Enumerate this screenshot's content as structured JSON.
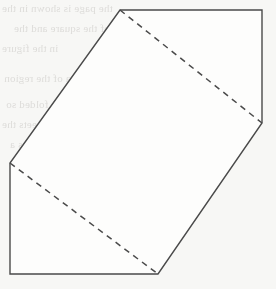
{
  "page": {
    "width": 276,
    "height": 289,
    "background_color": "#f7f7f5"
  },
  "figure": {
    "name": "folded-square-over-rectangle",
    "stroke_color": "#4a4a4a",
    "stroke_width": 1.4,
    "fill_color": "#fdfdfc",
    "dash_pattern": "6 5",
    "outline_points": "120,10 262,10 262,123 158,274 10,274 10,163",
    "vertices": [
      {
        "label": "apex-top",
        "x": 120,
        "y": 10
      },
      {
        "label": "corner-top-right",
        "x": 262,
        "y": 10
      },
      {
        "label": "vertex-right",
        "x": 262,
        "y": 123
      },
      {
        "label": "vertex-bottom",
        "x": 158,
        "y": 274
      },
      {
        "label": "corner-bottom-left",
        "x": 10,
        "y": 274
      },
      {
        "label": "vertex-left",
        "x": 10,
        "y": 163
      }
    ],
    "dashed_lines": [
      {
        "label": "fold-line-upper",
        "x1": 120,
        "y1": 10,
        "x2": 262,
        "y2": 123
      },
      {
        "label": "fold-line-lower",
        "x1": 10,
        "y1": 163,
        "x2": 158,
        "y2": 274
      }
    ],
    "solid_edges": [
      {
        "label": "edge-top",
        "x1": 120,
        "y1": 10,
        "x2": 262,
        "y2": 10
      },
      {
        "label": "edge-right",
        "x1": 262,
        "y1": 10,
        "x2": 262,
        "y2": 123
      },
      {
        "label": "edge-lower-right",
        "x1": 262,
        "y1": 123,
        "x2": 158,
        "y2": 274
      },
      {
        "label": "edge-bottom",
        "x1": 158,
        "y1": 274,
        "x2": 10,
        "y2": 274
      },
      {
        "label": "edge-left",
        "x1": 10,
        "y1": 274,
        "x2": 10,
        "y2": 163
      },
      {
        "label": "edge-upper-left",
        "x1": 10,
        "y1": 163,
        "x2": 120,
        "y2": 10
      }
    ]
  },
  "ghost_text": {
    "description": "faint show-through text from reverse side of scanned page",
    "color": "#c9c7c4",
    "lines": [
      {
        "text": "the page is shown in the",
        "x": 2,
        "y": 2,
        "size": 11
      },
      {
        "text": "of the square and the",
        "x": 14,
        "y": 22,
        "size": 11
      },
      {
        "text": "in the figure",
        "x": 2,
        "y": 42,
        "size": 11
      },
      {
        "text": "is the area of the region",
        "x": 4,
        "y": 72,
        "size": 11
      },
      {
        "text": "the rectangle is folded so",
        "x": 6,
        "y": 98,
        "size": 11
      },
      {
        "text": "that the corner meets the",
        "x": 2,
        "y": 118,
        "size": 11
      },
      {
        "text": "the crease is drawn as a",
        "x": 10,
        "y": 138,
        "size": 11
      },
      {
        "text": "dashed line",
        "x": 60,
        "y": 155,
        "size": 11
      },
      {
        "text": "in the figure shown",
        "x": 96,
        "y": 178,
        "size": 11
      }
    ]
  }
}
